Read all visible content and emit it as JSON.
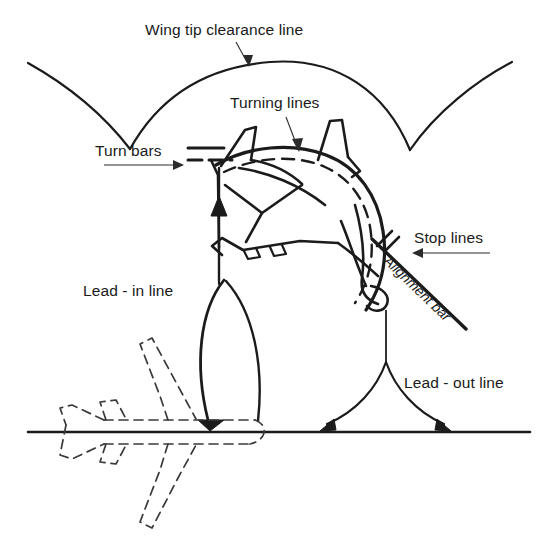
{
  "diagram": {
    "background_color": "#ffffff",
    "line_color": "#1b1b1b",
    "dashed_color": "#3a3a3a",
    "width": 549,
    "height": 547
  },
  "labels": {
    "wing_tip_clearance_line": "Wing tip clearance line",
    "turning_lines": "Turning lines",
    "turn_bars": "Turn bars",
    "stop_lines": "Stop lines",
    "alignment_bar": "Alignment bar",
    "lead_in_line": "Lead - in line",
    "lead_out_line": "Lead - out line"
  },
  "elements": [
    {
      "name": "wing-tip-clearance-line",
      "label": "Wing tip clearance line",
      "style": "solid-arc",
      "description": "scalloped arc across top of stand"
    },
    {
      "name": "turning-lines",
      "label": "Turning lines",
      "style": "solid-and-dashed-curve",
      "description": "curved guidance lines through the stand"
    },
    {
      "name": "turn-bars",
      "label": "Turn bars",
      "style": "short-bars",
      "description": "one solid bar above one dashed bar"
    },
    {
      "name": "stop-lines",
      "label": "Stop lines",
      "style": "short-diagonal-bars",
      "description": "pair of short diagonal bars"
    },
    {
      "name": "alignment-bar",
      "label": "Alignment bar",
      "style": "diagonal-bar",
      "description": "long diagonal bar crossing the lead-out line"
    },
    {
      "name": "lead-in-line",
      "label": "Lead - in line",
      "style": "solid-curve-arrow",
      "description": "curve from taxiway centreline into stand"
    },
    {
      "name": "lead-out-line",
      "label": "Lead - out line",
      "style": "solid-curve-arrow",
      "description": "curve from stand back out to taxiway centreline"
    },
    {
      "name": "taxiway-centreline",
      "label": "",
      "style": "solid-horizontal",
      "description": "horizontal ground / taxiway line"
    },
    {
      "name": "parked-aircraft-outline",
      "label": "",
      "style": "solid-plan-view",
      "description": "aircraft parked on stand, oblique plan view"
    },
    {
      "name": "taxiing-aircraft-outline",
      "label": "",
      "style": "dashed-plan-view",
      "description": "dashed aircraft silhouette on taxiway centreline"
    }
  ],
  "annotations": [
    {
      "name": "wing-tip-leader",
      "from": "Wing tip clearance line",
      "points_to": "apex of clearance arc"
    },
    {
      "name": "turning-lines-leader",
      "from": "Turning lines",
      "points_to": "curved turning line on stand"
    },
    {
      "name": "turn-bars-leader",
      "from": "Turn bars",
      "points_to": "short bars left of aircraft nose"
    },
    {
      "name": "stop-lines-leader",
      "from": "Stop lines",
      "points_to": "short diagonal bars right of aircraft"
    }
  ]
}
